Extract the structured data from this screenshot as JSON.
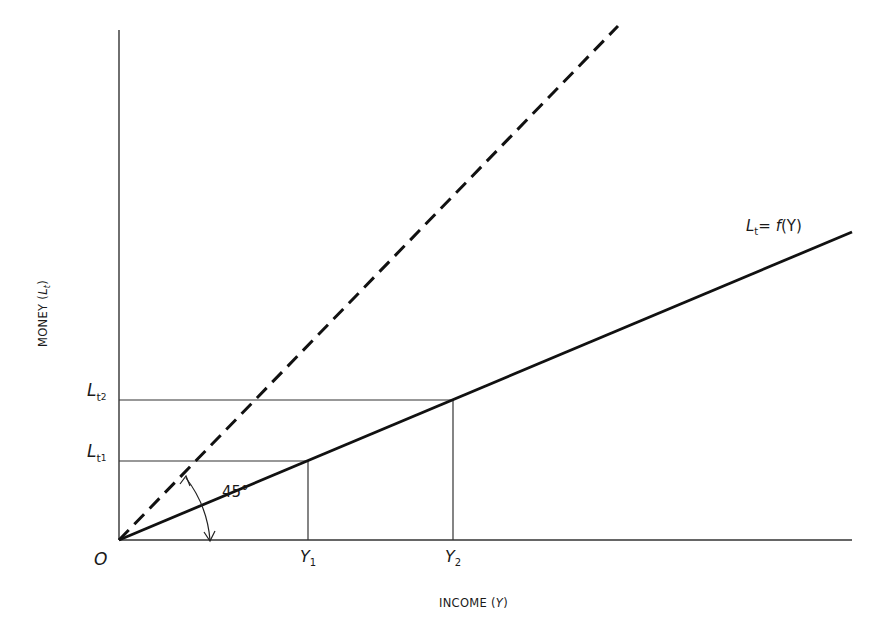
{
  "diagram": {
    "type": "economics-line-diagram",
    "y_axis": {
      "label": "MONEY",
      "label_paren_open": "(",
      "label_var": "L",
      "label_var_sub": "t",
      "label_paren_close": ")"
    },
    "x_axis": {
      "label": "INCOME",
      "label_paren_open": "(",
      "label_var": "Y",
      "label_paren_close": ")"
    },
    "origin_label": "O",
    "curve_label": {
      "var": "L",
      "sub": "t",
      "eq": "=",
      "func": "f",
      "arg": "(Y)"
    },
    "angle_label": "45°",
    "y_ticks": [
      {
        "var": "L",
        "sub": "t",
        "subsub": "1"
      },
      {
        "var": "L",
        "sub": "t",
        "subsub": "2"
      }
    ],
    "x_ticks": [
      {
        "var": "Y",
        "sub": "1"
      },
      {
        "var": "Y",
        "sub": "2"
      }
    ],
    "lines": {
      "solid": "Lt = f(Y)",
      "dashed": "45° reference line"
    },
    "colors": {
      "ink": "#1a1a1a",
      "axis": "#333333",
      "background": "#ffffff"
    }
  }
}
